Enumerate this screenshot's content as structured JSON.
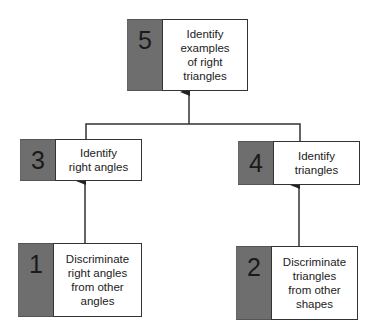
{
  "diagram": {
    "type": "learning hierarchy",
    "nodes": [
      {
        "id": "5",
        "number": "5",
        "text": "Identify examples of right triangles",
        "lines": [
          "Identify",
          "examples",
          "of right",
          "triangles"
        ]
      },
      {
        "id": "3",
        "number": "3",
        "text": "Identify right angles",
        "lines": [
          "Identify",
          "right angles"
        ]
      },
      {
        "id": "4",
        "number": "4",
        "text": "Identify triangles",
        "lines": [
          "Identify",
          "triangles"
        ]
      },
      {
        "id": "1",
        "number": "1",
        "text": "Discriminate right angles from other angles",
        "lines": [
          "Discriminate",
          "right angles",
          "from other",
          "angles"
        ]
      },
      {
        "id": "2",
        "number": "2",
        "text": "Discriminate triangles from other shapes",
        "lines": [
          "Discriminate",
          "triangles",
          "from other",
          "shapes"
        ]
      }
    ],
    "edges": [
      {
        "from": "1",
        "to": "3"
      },
      {
        "from": "2",
        "to": "4"
      },
      {
        "from": "3",
        "to": "5"
      },
      {
        "from": "4",
        "to": "5"
      }
    ],
    "colors": {
      "number_block": "#6e6e6e",
      "label_bg": "#ffffff",
      "border": "#333333"
    }
  }
}
